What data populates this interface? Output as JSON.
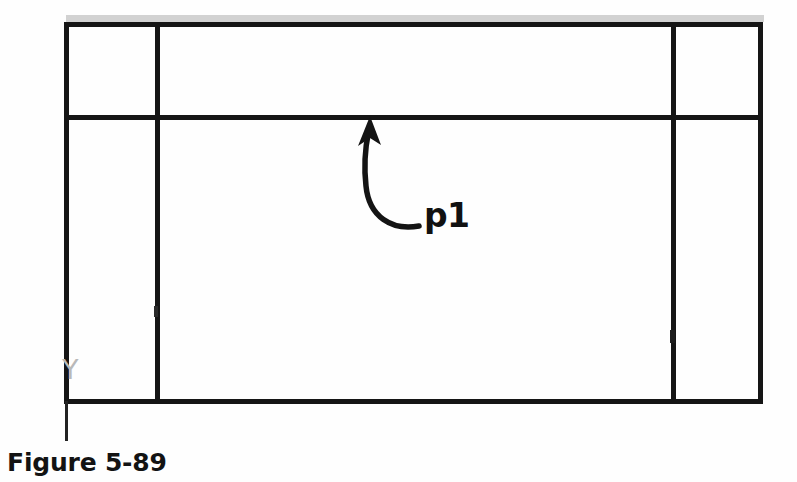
{
  "figure": {
    "caption": "Figure 5-89",
    "callout_label": "p1",
    "axis_label": "Y",
    "background_color": "#fefefe",
    "line_color": "#151515",
    "axis_label_color": "#b9b9b9",
    "scan_shadow_color": "#cfcfcf"
  },
  "diagram_data": {
    "type": "technical-line-drawing",
    "description": "Rectangular frame divided by one horizontal divider near the top and two vertical dividers, with a curved leader arrow pointing to the horizontal divider labelled p1.",
    "frame": {
      "left": 64,
      "top": 22,
      "right": 763,
      "bottom": 403,
      "stroke_width": 5
    },
    "dividers": [
      {
        "name": "horizontal-divider",
        "orientation": "horizontal",
        "position": 117,
        "from": 64,
        "to": 763,
        "stroke_width": 5
      },
      {
        "name": "vertical-divider-left",
        "orientation": "vertical",
        "position": 157,
        "from": 22,
        "to": 403,
        "stroke_width": 5
      },
      {
        "name": "vertical-divider-right",
        "orientation": "vertical",
        "position": 673,
        "from": 22,
        "to": 403,
        "stroke_width": 5
      }
    ],
    "tick_marks": [
      {
        "name": "tick-left-divider",
        "x": 157,
        "y": 311
      },
      {
        "name": "tick-right-divider",
        "x": 673,
        "y": 336
      }
    ],
    "axis_tail": {
      "name": "y-axis-tail",
      "x": 66,
      "from": 403,
      "to": 441,
      "stroke_width": 3
    },
    "leader_arrow": {
      "name": "leader-arrow-p1",
      "tip": {
        "x": 370,
        "y": 119
      },
      "tail": {
        "x": 419,
        "y": 226
      },
      "arrowhead": "solid-triangle",
      "curve": "M 419 226 C 392 230 369 216 366 186 C 363 163 366 143 368 131"
    },
    "scan_shadow": {
      "x": 64,
      "y": 15,
      "width": 700,
      "height": 7
    }
  }
}
